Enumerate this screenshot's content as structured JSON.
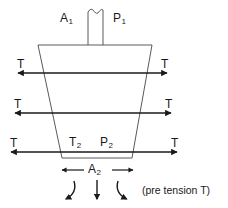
{
  "figure": {
    "background_color": "#ffffff",
    "stroke_color": "#1a1a1a",
    "outline_color": "#555555",
    "width": 228,
    "height": 208
  },
  "labels": {
    "area_top": "A",
    "area_top_sub": "1",
    "pressure_top": "P",
    "pressure_top_sub": "1",
    "tension_row1_left": "T",
    "tension_row1_right": "T",
    "tension_row2_left": "T",
    "tension_row2_right": "T",
    "tension_row3_left": "T",
    "tension_row3_right": "T",
    "tension_bottom": "T",
    "tension_bottom_sub": "2",
    "pressure_bottom": "P",
    "pressure_bottom_sub": "2",
    "area_bottom": "A",
    "area_bottom_sub": "2",
    "note": "(pre tension T)"
  },
  "geometry": {
    "stem": {
      "left": 88,
      "right": 103,
      "top": 9,
      "bottom": 46
    },
    "body_top_left": 38,
    "body_top_right": 152,
    "body_top_y": 45,
    "body_bottom_left": 62,
    "body_bottom_right": 132,
    "body_bottom_y": 158,
    "tension_lines_y": [
      73,
      113,
      152
    ],
    "dimension_line_y": 170
  }
}
